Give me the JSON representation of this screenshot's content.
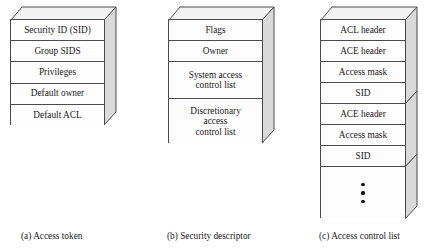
{
  "figure": {
    "kind": "three-part structure diagram",
    "colors": {
      "stroke": "#4a4a4a",
      "face_fill": "#fdfdfd",
      "top_face_fill": "#f2f2f2",
      "side_face_fill": "#d9d9d9",
      "text": "#1a1a1a",
      "dot": "#111111"
    }
  },
  "panels": [
    {
      "id": "access-token",
      "caption": "(a) Access token",
      "rows": [
        {
          "label": "Security ID (SID)"
        },
        {
          "label": "Group SIDS"
        },
        {
          "label": "Privileges"
        },
        {
          "label": "Default owner"
        },
        {
          "label": "Default ACL"
        }
      ]
    },
    {
      "id": "security-descriptor",
      "caption": "(b) Security descriptor",
      "rows": [
        {
          "label": "Flags"
        },
        {
          "label": "Owner"
        },
        {
          "label": "System access\ncontrol list"
        },
        {
          "label": "Discretionary\naccess\ncontrol list"
        }
      ]
    },
    {
      "id": "access-control-list",
      "caption": "(c) Access control list",
      "rows": [
        {
          "label": "ACL header"
        },
        {
          "label": "ACE header"
        },
        {
          "label": "Access mask"
        },
        {
          "label": "SID"
        },
        {
          "label": "ACE header"
        },
        {
          "label": "Access mask"
        },
        {
          "label": "SID"
        },
        {
          "label": "",
          "dots": 3
        }
      ]
    }
  ]
}
